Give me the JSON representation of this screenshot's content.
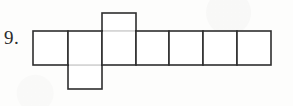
{
  "page": {
    "width": 293,
    "height": 106,
    "background_color": "#fdfdfc",
    "line_color": "#2e2e2e"
  },
  "problem": {
    "number_label": "9.",
    "figure_type": "polyomino-net",
    "description": "Net of a rectangular box drawn as an outlined grid of seven unit squares"
  },
  "figure": {
    "cell_size": 34,
    "origin": {
      "x": 33,
      "y": 31
    },
    "main_row": {
      "y_top": 31,
      "y_bottom": 65,
      "x_start": 33,
      "x_end": 271,
      "cell_count": 7,
      "x_dividers": [
        33,
        68,
        102,
        136,
        169,
        203,
        237,
        271
      ]
    },
    "cells": [
      {
        "index": 1,
        "x": 33,
        "y": 31,
        "w": 35,
        "h": 34,
        "position": "row"
      },
      {
        "index": 2,
        "x": 68,
        "y": 31,
        "w": 34,
        "h": 34,
        "position": "row"
      },
      {
        "index": 3,
        "x": 68,
        "y": 65,
        "w": 34,
        "h": 24,
        "position": "below"
      },
      {
        "index": 4,
        "x": 102,
        "y": 13,
        "w": 34,
        "h": 18,
        "position": "above"
      },
      {
        "index": 5,
        "x": 102,
        "y": 31,
        "w": 34,
        "h": 34,
        "position": "row"
      },
      {
        "index": 6,
        "x": 136,
        "y": 31,
        "w": 33,
        "h": 34,
        "position": "row"
      },
      {
        "index": 7,
        "x": 169,
        "y": 31,
        "w": 34,
        "h": 34,
        "position": "row"
      },
      {
        "index": 8,
        "x": 203,
        "y": 31,
        "w": 34,
        "h": 34,
        "position": "row"
      },
      {
        "index": 9,
        "x": 237,
        "y": 31,
        "w": 34,
        "h": 34,
        "position": "row"
      }
    ]
  }
}
